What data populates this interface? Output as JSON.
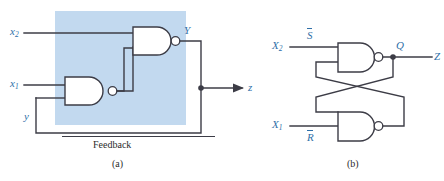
{
  "figure": {
    "title_a": "(a)",
    "title_b": "(b)",
    "feedback_label": "Feedback",
    "colors": {
      "wire": "#3c3c46",
      "label_blue": "#2f6fa8",
      "shaded_region": "#c2d9ef",
      "caption_gray": "#2b2b2b"
    }
  },
  "circuit_a": {
    "name": "NAND latch with explicit feedback",
    "inputs": [
      {
        "id": "x2",
        "base": "x",
        "sub": "2"
      },
      {
        "id": "x1",
        "base": "x",
        "sub": "1"
      },
      {
        "id": "y",
        "base": "y",
        "sub": ""
      }
    ],
    "internal_signal": {
      "id": "Y",
      "base": "Y",
      "sub": ""
    },
    "output": {
      "id": "z",
      "base": "z",
      "sub": ""
    },
    "gates": [
      {
        "id": "nand-upper",
        "type": "NAND",
        "inputs": [
          "x2",
          "nand-lower-out"
        ],
        "output": "Y"
      },
      {
        "id": "nand-lower",
        "type": "NAND",
        "inputs": [
          "x1",
          "y"
        ],
        "output": "nand-lower-out"
      }
    ],
    "annotation": "Feedback"
  },
  "circuit_b": {
    "name": "Cross-coupled NAND SR latch",
    "inputs": [
      {
        "id": "X2",
        "base": "X",
        "sub": "2"
      },
      {
        "id": "X1",
        "base": "X",
        "sub": "1"
      }
    ],
    "signal_labels": [
      {
        "id": "S-bar",
        "base": "S",
        "sub": "",
        "overbar": true
      },
      {
        "id": "R-bar",
        "base": "R",
        "sub": "",
        "overbar": true
      }
    ],
    "outputs": [
      {
        "id": "Q",
        "base": "Q",
        "sub": ""
      },
      {
        "id": "Z",
        "base": "Z",
        "sub": ""
      }
    ],
    "gates": [
      {
        "id": "nand-top",
        "type": "NAND",
        "inputs": [
          "X2",
          "cross-from-bottom"
        ],
        "output": "Q"
      },
      {
        "id": "nand-bottom",
        "type": "NAND",
        "inputs": [
          "cross-from-top",
          "X1"
        ],
        "output": "Qbar"
      }
    ]
  }
}
